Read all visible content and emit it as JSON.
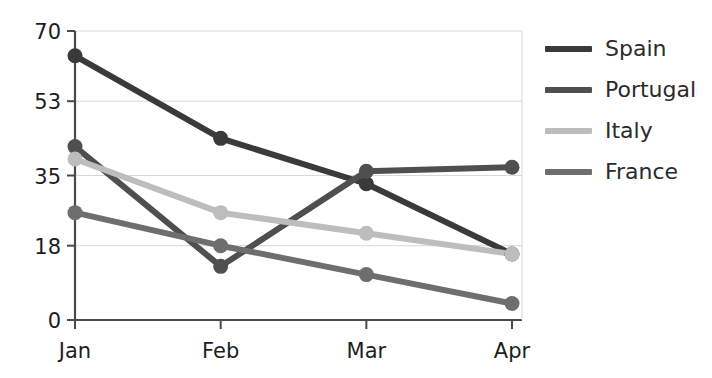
{
  "chart_data": {
    "type": "line",
    "title": "",
    "xlabel": "",
    "ylabel": "",
    "categories": [
      "Jan",
      "Feb",
      "Mar",
      "Apr"
    ],
    "ytick_labels": [
      "0",
      "18",
      "35",
      "53",
      "70"
    ],
    "ytick_values": [
      0,
      18,
      35,
      53,
      70
    ],
    "ylim": [
      0,
      70
    ],
    "grid": "horizontal",
    "legend_position": "right",
    "series": [
      {
        "name": "Spain",
        "color": "#3a3a3a",
        "values": [
          64,
          44,
          33,
          16
        ]
      },
      {
        "name": "Portugal",
        "color": "#4f4f4f",
        "values": [
          42,
          13,
          36,
          37
        ]
      },
      {
        "name": "Italy",
        "color": "#bdbdbd",
        "values": [
          39,
          26,
          21,
          16
        ]
      },
      {
        "name": "France",
        "color": "#6e6e6e",
        "values": [
          26,
          18,
          11,
          4
        ]
      }
    ]
  },
  "legend": {
    "items": [
      {
        "label": "Spain"
      },
      {
        "label": "Portugal"
      },
      {
        "label": "Italy"
      },
      {
        "label": "France"
      }
    ]
  },
  "colors": {
    "axis": "#4a4a4a",
    "grid": "#d8d8d8",
    "text": "#1d1d1d",
    "background": "#ffffff"
  }
}
